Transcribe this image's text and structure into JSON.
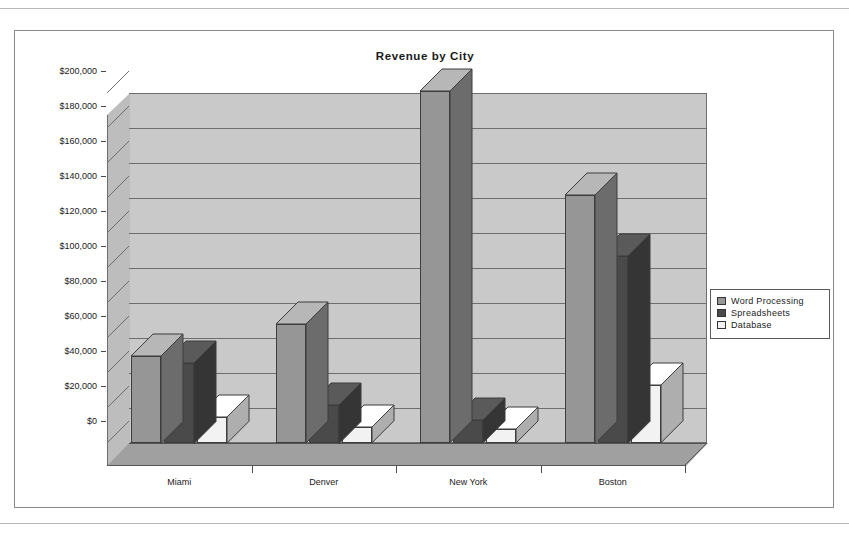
{
  "page": {
    "top_rule": "",
    "bottom_rule": ""
  },
  "chart_data": {
    "type": "bar",
    "title": "Revenue by City",
    "subtitle": "",
    "xlabel": "",
    "ylabel": "",
    "categories": [
      "Miami",
      "Denver",
      "New York",
      "Boston"
    ],
    "series": [
      {
        "name": "Word Processing",
        "color": "#969696",
        "values": [
          50000,
          68000,
          201000,
          142000
        ]
      },
      {
        "name": "Spreadsheets",
        "color": "#4a4a4a",
        "values": [
          46000,
          22000,
          13000,
          107000
        ]
      },
      {
        "name": "Database",
        "color": "#f2f2f2",
        "values": [
          15000,
          9000,
          8000,
          33000
        ]
      }
    ],
    "ylim": [
      0,
      200000
    ],
    "ytick_step": 20000,
    "ytick_labels": [
      "$0",
      "$20,000",
      "$40,000",
      "$60,000",
      "$80,000",
      "$100,000",
      "$120,000",
      "$140,000",
      "$160,000",
      "$180,000",
      "$200,000"
    ],
    "ytick_values": [
      0,
      20000,
      40000,
      60000,
      80000,
      100000,
      120000,
      140000,
      160000,
      180000,
      200000
    ],
    "grid": true,
    "legend_position": "right",
    "three_d": true,
    "plot_background": "#c9c9c9",
    "floor_color": "#a0a0a0",
    "wall_color": "#bdbdbd",
    "border_color": "#6e6e6e"
  },
  "legend": {
    "items": [
      {
        "label": "Word Processing",
        "color": "#969696"
      },
      {
        "label": "Spreadsheets",
        "color": "#4a4a4a"
      },
      {
        "label": "Database",
        "color": "#f2f2f2"
      }
    ]
  }
}
